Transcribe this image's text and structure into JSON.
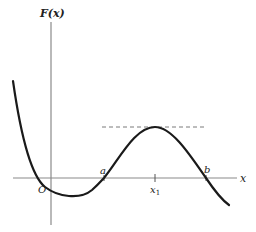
{
  "figure": {
    "y_axis_label": "F(x)",
    "x_axis_label": "x",
    "origin_label": "O",
    "point_a_label": "a",
    "point_b_label": "b",
    "x1_label": "x",
    "x1_subscript": "1"
  },
  "colors": {
    "curve": "#1a1a1a",
    "axes": "#8a8a8a",
    "dashed": "#7a7a7a",
    "background": "#ffffff"
  }
}
